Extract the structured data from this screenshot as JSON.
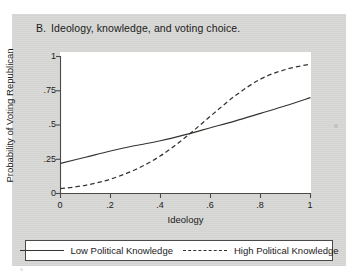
{
  "figure": {
    "panel_letter": "B.",
    "title": "Ideology, knowledge, and voting choice.",
    "background_color": "#d8d8d6",
    "plot_background_color": "#ffffff",
    "axis_color": "#4a4a4a"
  },
  "legend": {
    "position": "bottom",
    "items": [
      {
        "label": "Low Political Knowledge",
        "style": "solid"
      },
      {
        "label": "High Political Knowledge",
        "style": "dashed"
      }
    ]
  },
  "chart_data": {
    "type": "line",
    "title": "Ideology, knowledge, and voting choice.",
    "xlabel": "Ideology",
    "ylabel": "Probability of Voting Republican",
    "xlim": [
      0,
      1
    ],
    "ylim": [
      0,
      1
    ],
    "grid": false,
    "legend_position": "bottom",
    "xticks": [
      0,
      0.2,
      0.4,
      0.6,
      0.8,
      1
    ],
    "xticklabels": [
      "0",
      ".2",
      ".4",
      ".6",
      ".8",
      "1"
    ],
    "yticks": [
      0,
      0.25,
      0.5,
      0.75,
      1
    ],
    "yticklabels": [
      "0",
      ".25",
      ".5",
      ".75",
      "1"
    ],
    "x": [
      0,
      0.1,
      0.2,
      0.3,
      0.4,
      0.5,
      0.6,
      0.7,
      0.8,
      0.9,
      1
    ],
    "series": [
      {
        "name": "Low Political Knowledge",
        "style": "solid",
        "color": "#33332f",
        "values": [
          0.22,
          0.265,
          0.31,
          0.35,
          0.385,
          0.43,
          0.48,
          0.53,
          0.585,
          0.64,
          0.7
        ]
      },
      {
        "name": "High Political Knowledge",
        "style": "dashed",
        "color": "#33332f",
        "values": [
          0.035,
          0.06,
          0.105,
          0.175,
          0.275,
          0.41,
          0.565,
          0.715,
          0.835,
          0.905,
          0.945
        ]
      }
    ],
    "annotations": [
      {
        "text": "curves cross",
        "x": 0.52,
        "y": 0.5
      }
    ]
  }
}
